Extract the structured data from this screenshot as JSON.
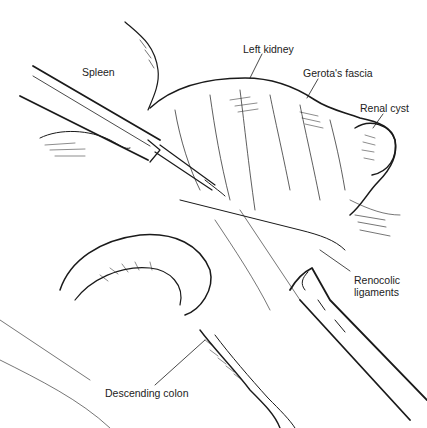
{
  "illustration": {
    "subject": "Laparoscopic exposure of left renal cyst",
    "labels": {
      "spleen": "Spleen",
      "left_kidney": "Left kidney",
      "gerotas_fascia": "Gerota's fascia",
      "renal_cyst": "Renal cyst",
      "renocolic_1": "Renocolic",
      "renocolic_2": "ligaments",
      "descending_colon": "Descending colon"
    },
    "colors": {
      "line": "#1a1a1a",
      "background": "#ffffff"
    }
  }
}
